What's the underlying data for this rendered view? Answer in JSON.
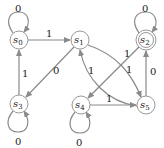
{
  "diagram": {
    "type": "state-machine",
    "nodes": [
      {
        "id": "s0",
        "label": "s",
        "sub": "0",
        "x": 19,
        "y": 40,
        "accepting": false
      },
      {
        "id": "s1",
        "label": "s",
        "sub": "1",
        "x": 80,
        "y": 40,
        "accepting": false
      },
      {
        "id": "s2",
        "label": "s",
        "sub": "2",
        "x": 146,
        "y": 40,
        "accepting": true
      },
      {
        "id": "s3",
        "label": "s",
        "sub": "3",
        "x": 19,
        "y": 104,
        "accepting": false
      },
      {
        "id": "s4",
        "label": "s",
        "sub": "4",
        "x": 81,
        "y": 105,
        "accepting": false
      },
      {
        "id": "s5",
        "label": "s",
        "sub": "5",
        "x": 146,
        "y": 105,
        "accepting": false
      }
    ],
    "edges": [
      {
        "from": "s0",
        "to": "s0",
        "label": "0"
      },
      {
        "from": "s0",
        "to": "s1",
        "label": "1"
      },
      {
        "from": "s1",
        "to": "s3",
        "label": "0"
      },
      {
        "from": "s1",
        "to": "s5",
        "label": "1"
      },
      {
        "from": "s5",
        "to": "s1",
        "label": "1"
      },
      {
        "from": "s2",
        "to": "s2",
        "label": "0"
      },
      {
        "from": "s2",
        "to": "s4",
        "label": "1"
      },
      {
        "from": "s5",
        "to": "s2",
        "label": "0"
      },
      {
        "from": "s3",
        "to": "s0",
        "label": "1"
      },
      {
        "from": "s3",
        "to": "s3",
        "label": "0"
      },
      {
        "from": "s4",
        "to": "s4",
        "label": "0"
      },
      {
        "from": "s4",
        "to": "s5",
        "label": "1"
      }
    ]
  }
}
